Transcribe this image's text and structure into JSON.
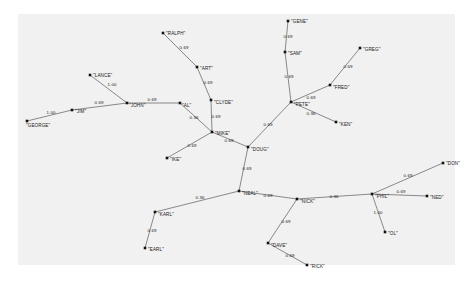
{
  "figure": {
    "background_color": "#ffffff",
    "plot_background_color": "#f1f1f1",
    "node_color": "#111111",
    "edge_color": "#5a5a5a",
    "label_color": "#1a1a1a"
  },
  "chart_data": {
    "type": "network",
    "title": "",
    "xlabel": "",
    "ylabel": "",
    "grid": false,
    "legend": "none",
    "directed": false,
    "node_count": 26,
    "edge_count": 25,
    "edge_weight_values": [
      "1.00",
      "0.69",
      "0.36"
    ],
    "nodes": [
      {
        "id": "GEORGE",
        "label": "\"GEORGE\"",
        "x": 27,
        "y": 121,
        "label_dx": -1,
        "label_dy": 6,
        "label_anchor": "start"
      },
      {
        "id": "JIM",
        "label": "\"JIM\"",
        "x": 72,
        "y": 110,
        "label_dx": 3,
        "label_dy": 3,
        "label_anchor": "start"
      },
      {
        "id": "LANCE",
        "label": "\"LANCE\"",
        "x": 90,
        "y": 75,
        "label_dx": 3,
        "label_dy": 2,
        "label_anchor": "start"
      },
      {
        "id": "JOHN",
        "label": "\"JOHN\"",
        "x": 127,
        "y": 103,
        "label_dx": 2,
        "label_dy": 4,
        "label_anchor": "start"
      },
      {
        "id": "AL",
        "label": "\"AL\"",
        "x": 180,
        "y": 103,
        "label_dx": 2,
        "label_dy": 4,
        "label_anchor": "start"
      },
      {
        "id": "RALPH",
        "label": "\"RALPH\"",
        "x": 163,
        "y": 33,
        "label_dx": 3,
        "label_dy": 2,
        "label_anchor": "start"
      },
      {
        "id": "ART",
        "label": "\"ART\"",
        "x": 197,
        "y": 67,
        "label_dx": 3,
        "label_dy": 3,
        "label_anchor": "start"
      },
      {
        "id": "CLYDE",
        "label": "\"CLYDE\"",
        "x": 211,
        "y": 100,
        "label_dx": 3,
        "label_dy": 4,
        "label_anchor": "start"
      },
      {
        "id": "MIKE",
        "label": "\"MIKE\"",
        "x": 212,
        "y": 132,
        "label_dx": 3,
        "label_dy": 3,
        "label_anchor": "start"
      },
      {
        "id": "IKE",
        "label": "\"IKE\"",
        "x": 167,
        "y": 158,
        "label_dx": 3,
        "label_dy": 3,
        "label_anchor": "start"
      },
      {
        "id": "DOUG",
        "label": "\"DOUG\"",
        "x": 248,
        "y": 147,
        "label_dx": 3,
        "label_dy": 4,
        "label_anchor": "start"
      },
      {
        "id": "NEAL",
        "label": "\"NEAL\"",
        "x": 239,
        "y": 191,
        "label_dx": 3,
        "label_dy": 4,
        "label_anchor": "start"
      },
      {
        "id": "PETE",
        "label": "\"PETE\"",
        "x": 291,
        "y": 102,
        "label_dx": 3,
        "label_dy": 4,
        "label_anchor": "start"
      },
      {
        "id": "SAM",
        "label": "\"SAM\"",
        "x": 285,
        "y": 52,
        "label_dx": 3,
        "label_dy": 3,
        "label_anchor": "start"
      },
      {
        "id": "GENE",
        "label": "\"GENE\"",
        "x": 288,
        "y": 21,
        "label_dx": 3,
        "label_dy": 2,
        "label_anchor": "start"
      },
      {
        "id": "FRED",
        "label": "\"FRED\"",
        "x": 330,
        "y": 85,
        "label_dx": 3,
        "label_dy": 4,
        "label_anchor": "start"
      },
      {
        "id": "GREG",
        "label": "\"GREG\"",
        "x": 360,
        "y": 48,
        "label_dx": 3,
        "label_dy": 3,
        "label_anchor": "start"
      },
      {
        "id": "KEN",
        "label": "\"KEN\"",
        "x": 336,
        "y": 122,
        "label_dx": 3,
        "label_dy": 4,
        "label_anchor": "start"
      },
      {
        "id": "KARL",
        "label": "\"KARL\"",
        "x": 155,
        "y": 212,
        "label_dx": 3,
        "label_dy": 4,
        "label_anchor": "start"
      },
      {
        "id": "EARL",
        "label": "\"EARL\"",
        "x": 145,
        "y": 248,
        "label_dx": 3,
        "label_dy": 3,
        "label_anchor": "start"
      },
      {
        "id": "NICK",
        "label": "\"NICK\"",
        "x": 297,
        "y": 199,
        "label_dx": 3,
        "label_dy": 4,
        "label_anchor": "start"
      },
      {
        "id": "DAVE",
        "label": "\"DAVE\"",
        "x": 268,
        "y": 243,
        "label_dx": 3,
        "label_dy": 4,
        "label_anchor": "start"
      },
      {
        "id": "RICK",
        "label": "\"RICK\"",
        "x": 307,
        "y": 265,
        "label_dx": 3,
        "label_dy": 3,
        "label_anchor": "start"
      },
      {
        "id": "PHIL",
        "label": "\"PHIL\"",
        "x": 372,
        "y": 194,
        "label_dx": 3,
        "label_dy": 4,
        "label_anchor": "start"
      },
      {
        "id": "NED",
        "label": "\"NED\"",
        "x": 427,
        "y": 196,
        "label_dx": 3,
        "label_dy": 3,
        "label_anchor": "start"
      },
      {
        "id": "DON",
        "label": "\"DON\"",
        "x": 443,
        "y": 163,
        "label_dx": 3,
        "label_dy": 2,
        "label_anchor": "start"
      },
      {
        "id": "OL",
        "label": "\"OL\"",
        "x": 385,
        "y": 232,
        "label_dx": 3,
        "label_dy": 3,
        "label_anchor": "start"
      }
    ],
    "edges": [
      {
        "source": "GEORGE",
        "target": "JIM",
        "weight": "1.00",
        "lx": 51,
        "ly": 114
      },
      {
        "source": "JIM",
        "target": "JOHN",
        "weight": "0.69",
        "lx": 99,
        "ly": 104
      },
      {
        "source": "LANCE",
        "target": "JOHN",
        "weight": "1.00",
        "lx": 112,
        "ly": 86
      },
      {
        "source": "JOHN",
        "target": "AL",
        "weight": "0.69",
        "lx": 152,
        "ly": 101
      },
      {
        "source": "RALPH",
        "target": "ART",
        "weight": "0.69",
        "lx": 184,
        "ly": 49
      },
      {
        "source": "ART",
        "target": "CLYDE",
        "weight": "0.69",
        "lx": 208,
        "ly": 84
      },
      {
        "source": "CLYDE",
        "target": "MIKE",
        "weight": "0.69",
        "lx": 216,
        "ly": 118
      },
      {
        "source": "AL",
        "target": "MIKE",
        "weight": "0.36",
        "lx": 194,
        "ly": 119
      },
      {
        "source": "MIKE",
        "target": "IKE",
        "weight": "0.69",
        "lx": 192,
        "ly": 147
      },
      {
        "source": "MIKE",
        "target": "DOUG",
        "weight": "0.69",
        "lx": 229,
        "ly": 142
      },
      {
        "source": "DOUG",
        "target": "PETE",
        "weight": "0.69",
        "lx": 268,
        "ly": 126
      },
      {
        "source": "DOUG",
        "target": "NEAL",
        "weight": "0.69",
        "lx": 247,
        "ly": 170
      },
      {
        "source": "GENE",
        "target": "SAM",
        "weight": "0.69",
        "lx": 288,
        "ly": 38
      },
      {
        "source": "SAM",
        "target": "PETE",
        "weight": "0.69",
        "lx": 289,
        "ly": 78
      },
      {
        "source": "PETE",
        "target": "FRED",
        "weight": "0.69",
        "lx": 311,
        "ly": 99
      },
      {
        "source": "FRED",
        "target": "GREG",
        "weight": "0.69",
        "lx": 348,
        "ly": 68
      },
      {
        "source": "PETE",
        "target": "KEN",
        "weight": "0.36",
        "lx": 311,
        "ly": 115
      },
      {
        "source": "NEAL",
        "target": "KARL",
        "weight": "0.36",
        "lx": 200,
        "ly": 199
      },
      {
        "source": "KARL",
        "target": "EARL",
        "weight": "0.69",
        "lx": 152,
        "ly": 232
      },
      {
        "source": "NEAL",
        "target": "NICK",
        "weight": "0.69",
        "lx": 268,
        "ly": 197
      },
      {
        "source": "NICK",
        "target": "DAVE",
        "weight": "0.69",
        "lx": 286,
        "ly": 223
      },
      {
        "source": "DAVE",
        "target": "RICK",
        "weight": "0.69",
        "lx": 290,
        "ly": 257
      },
      {
        "source": "NICK",
        "target": "PHIL",
        "weight": "0.36",
        "lx": 334,
        "ly": 198
      },
      {
        "source": "PHIL",
        "target": "NED",
        "weight": "0.69",
        "lx": 401,
        "ly": 193
      },
      {
        "source": "PHIL",
        "target": "DON",
        "weight": "0.69",
        "lx": 408,
        "ly": 177
      },
      {
        "source": "PHIL",
        "target": "OL",
        "weight": "1.00",
        "lx": 378,
        "ly": 214
      }
    ]
  }
}
